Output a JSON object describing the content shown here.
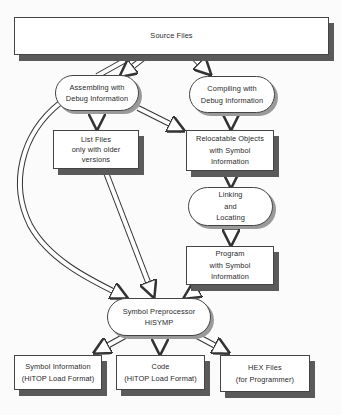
{
  "diagram": {
    "nodes": {
      "source_files": {
        "lines": [
          "Source Files"
        ]
      },
      "assembling": {
        "lines": [
          "Assembling with",
          "Debug Information"
        ]
      },
      "compiling": {
        "lines": [
          "Compiling with",
          "Debug Information"
        ]
      },
      "list_files": {
        "lines": [
          "List Files",
          "only with older",
          "versions"
        ]
      },
      "relocatable": {
        "lines": [
          "Relocatable Objects",
          "with Symbol",
          "Information"
        ]
      },
      "linking": {
        "lines": [
          "Linking",
          "and",
          "Locating"
        ]
      },
      "program": {
        "lines": [
          "Program",
          "with Symbol",
          "Information"
        ]
      },
      "preprocessor": {
        "lines": [
          "Symbol Preprocessor",
          "HiSYMP"
        ]
      },
      "symbol_info": {
        "lines": [
          "Symbol Information",
          "(HiTOP Load Format)"
        ]
      },
      "code": {
        "lines": [
          "Code",
          "(HiTOP Load Format)"
        ]
      },
      "hex_files": {
        "lines": [
          "HEX Files",
          "(for Programmer)"
        ]
      }
    },
    "edges": [
      {
        "from": "Source Files",
        "to": "Assembling with Debug Information"
      },
      {
        "from": "Source Files",
        "to": "Assembling with Debug Information"
      },
      {
        "from": "Source Files",
        "to": "Compiling with Debug Information"
      },
      {
        "from": "Assembling with Debug Information",
        "to": "List Files"
      },
      {
        "from": "Assembling with Debug Information",
        "to": "Relocatable Objects with Symbol Information"
      },
      {
        "from": "Assembling with Debug Information",
        "to": "Symbol Preprocessor HiSYMP"
      },
      {
        "from": "Compiling with Debug Information",
        "to": "Relocatable Objects with Symbol Information"
      },
      {
        "from": "Relocatable Objects with Symbol Information",
        "to": "Linking and Locating"
      },
      {
        "from": "Linking and Locating",
        "to": "Program with Symbol Information"
      },
      {
        "from": "List Files",
        "to": "Symbol Preprocessor HiSYMP"
      },
      {
        "from": "Program with Symbol Information",
        "to": "Symbol Preprocessor HiSYMP"
      },
      {
        "from": "Symbol Preprocessor HiSYMP",
        "to": "Symbol Information (HiTOP Load Format)"
      },
      {
        "from": "Symbol Preprocessor HiSYMP",
        "to": "Code (HiTOP Load Format)"
      },
      {
        "from": "Symbol Preprocessor HiSYMP",
        "to": "HEX Files (for Programmer)"
      }
    ]
  },
  "colors": {
    "outline": "#444444",
    "shadow": "#5a5a5a",
    "fill": "#ffffff"
  }
}
